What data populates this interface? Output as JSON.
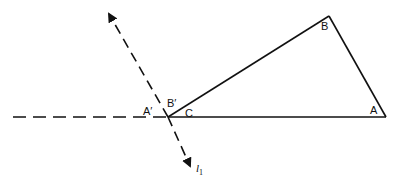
{
  "diagram": {
    "colors": {
      "stroke": "#111111",
      "background": "#ffffff"
    },
    "vertices": {
      "A": {
        "label": "A",
        "x": 386,
        "y": 117
      },
      "B": {
        "label": "B",
        "x": 329,
        "y": 16
      },
      "C": {
        "label": "C",
        "x": 168,
        "y": 117
      }
    },
    "angle_labels": {
      "A_prime": "A′",
      "B_prime": "B′"
    },
    "line_label": {
      "name": "l",
      "subscript": "1"
    }
  }
}
